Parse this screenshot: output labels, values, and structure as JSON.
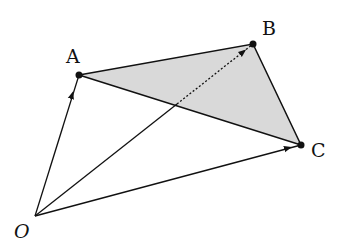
{
  "diagram": {
    "points": {
      "O": {
        "label": "O",
        "x": 35,
        "y": 216
      },
      "A": {
        "label": "A",
        "x": 79,
        "y": 75
      },
      "B": {
        "label": "B",
        "x": 253,
        "y": 44
      },
      "C": {
        "label": "C",
        "x": 301,
        "y": 145
      }
    },
    "triangle_fill": "#d9d9d9",
    "stroke_color": "#111111",
    "vectors": [
      "OA",
      "OB",
      "OC"
    ],
    "triangle": "ABC",
    "dotted_segment": "OB inside triangle"
  }
}
